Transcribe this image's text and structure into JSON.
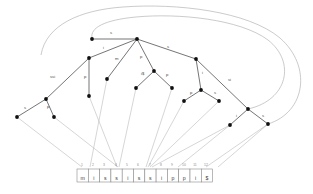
{
  "figure": {
    "string": "mississippi$",
    "colors": {
      "edge": "#3a3a3a",
      "node": "#101010",
      "suffix_link": "#a8a8a8",
      "leaf_pointer": "#b3b3b3",
      "cell_border": "#8a8a8a",
      "label_text": "#4a4a4a",
      "background": "#ffffff"
    }
  },
  "text_cells": [
    {
      "index": "1",
      "char": "m"
    },
    {
      "index": "2",
      "char": "i"
    },
    {
      "index": "3",
      "char": "s"
    },
    {
      "index": "4",
      "char": "s"
    },
    {
      "index": "5",
      "char": "i"
    },
    {
      "index": "6",
      "char": "s"
    },
    {
      "index": "7",
      "char": "s"
    },
    {
      "index": "8",
      "char": "i"
    },
    {
      "index": "9",
      "char": "p"
    },
    {
      "index": "10",
      "char": "p"
    },
    {
      "index": "11",
      "char": "i"
    },
    {
      "index": "12",
      "char": "$"
    }
  ],
  "nodes": [
    {
      "id": "root",
      "x": 137,
      "y": 39
    },
    {
      "id": "n-top-left",
      "x": 92,
      "y": 39
    },
    {
      "id": "n-i",
      "x": 89,
      "y": 58
    },
    {
      "id": "n-s",
      "x": 196,
      "y": 59
    },
    {
      "id": "n-m",
      "x": 107,
      "y": 79
    },
    {
      "id": "n-p",
      "x": 154,
      "y": 71
    },
    {
      "id": "n-pi",
      "x": 89,
      "y": 96
    },
    {
      "id": "n-si",
      "x": 46,
      "y": 99
    },
    {
      "id": "n-ssi-l",
      "x": 17,
      "y": 117
    },
    {
      "id": "n-ssi-r",
      "x": 54,
      "y": 117
    },
    {
      "id": "n-is",
      "x": 136,
      "y": 88
    },
    {
      "id": "n-pp",
      "x": 172,
      "y": 88
    },
    {
      "id": "n-i2",
      "x": 201,
      "y": 90
    },
    {
      "id": "n-p2",
      "x": 184,
      "y": 101
    },
    {
      "id": "n-s2",
      "x": 219,
      "y": 101
    },
    {
      "id": "n-si2",
      "x": 248,
      "y": 109
    },
    {
      "id": "n-i3",
      "x": 230,
      "y": 125
    },
    {
      "id": "n-s3",
      "x": 268,
      "y": 124
    }
  ],
  "edge_labels": [
    {
      "id": "lbl-root-s-left",
      "text": "s",
      "x": 110,
      "y": 34
    },
    {
      "id": "lbl-root-i",
      "text": "i",
      "x": 103,
      "y": 49
    },
    {
      "id": "lbl-root-s-right",
      "text": "s",
      "x": 167,
      "y": 48
    },
    {
      "id": "lbl-root-m",
      "text": "m",
      "x": 115,
      "y": 60
    },
    {
      "id": "lbl-root-p",
      "text": "p",
      "x": 140,
      "y": 58
    },
    {
      "id": "lbl-i-ssi",
      "text": "ssi",
      "x": 50,
      "y": 78
    },
    {
      "id": "lbl-i-p",
      "text": "p",
      "x": 84,
      "y": 78
    },
    {
      "id": "lbl-p-is",
      "text": "i$",
      "x": 141,
      "y": 75
    },
    {
      "id": "lbl-p-p",
      "text": "p",
      "x": 166,
      "y": 76
    },
    {
      "id": "lbl-s-i",
      "text": "i",
      "x": 202,
      "y": 74
    },
    {
      "id": "lbl-s-si",
      "text": "si",
      "x": 228,
      "y": 81
    },
    {
      "id": "lbl-i2-p",
      "text": "p",
      "x": 190,
      "y": 94
    },
    {
      "id": "lbl-i2-s",
      "text": "s",
      "x": 214,
      "y": 94
    },
    {
      "id": "lbl-si-s",
      "text": "s",
      "x": 24,
      "y": 109
    },
    {
      "id": "lbl-si-p",
      "text": "p",
      "x": 47,
      "y": 108
    },
    {
      "id": "lbl-si2-i",
      "text": "i",
      "x": 236,
      "y": 117
    },
    {
      "id": "lbl-si2-s",
      "text": "s",
      "x": 262,
      "y": 117
    }
  ]
}
